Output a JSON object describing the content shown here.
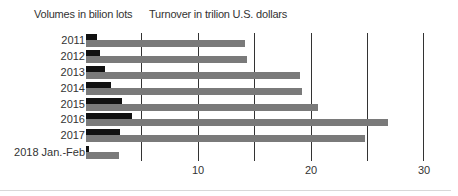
{
  "chart_data": {
    "type": "bar",
    "orientation": "horizontal",
    "title": "",
    "legend": [
      "Volumes in bilion lots",
      "Turnover in trilion U.S. dollars"
    ],
    "categories": [
      "2011",
      "2012",
      "2013",
      "2014",
      "2015",
      "2016",
      "2017",
      "2018 Jan.-Feb"
    ],
    "series": [
      {
        "name": "Volumes in bilion lots",
        "color": "#111111",
        "values": [
          1.0,
          1.2,
          1.7,
          2.2,
          3.2,
          4.1,
          3.0,
          0.3
        ]
      },
      {
        "name": "Turnover in trilion U.S. dollars",
        "color": "#7a7a7a",
        "values": [
          14.1,
          14.3,
          19.0,
          19.2,
          20.6,
          26.8,
          24.8,
          2.9
        ]
      }
    ],
    "xlim": [
      0,
      30
    ],
    "x_ticks": [
      10,
      20,
      30
    ],
    "gridlines": [
      5,
      10,
      15,
      20,
      25,
      30
    ],
    "xlabel": "",
    "ylabel": "",
    "grid": true,
    "legend_position": "top"
  },
  "legend": {
    "volumes": "Volumes in bilion lots",
    "turnover": "Turnover in trilion U.S. dollars"
  },
  "axis": {
    "ticks": [
      "10",
      "20",
      "30"
    ]
  },
  "rows": [
    {
      "label": "2011"
    },
    {
      "label": "2012"
    },
    {
      "label": "2013"
    },
    {
      "label": "2014"
    },
    {
      "label": "2015"
    },
    {
      "label": "2016"
    },
    {
      "label": "2017"
    },
    {
      "label": "2018 Jan.-Feb"
    }
  ]
}
